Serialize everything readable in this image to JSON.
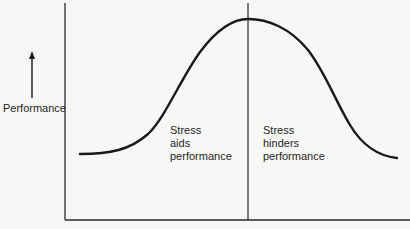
{
  "diagram": {
    "title": "",
    "type": "inverted-U performance curve",
    "y_axis": {
      "label": "Performance",
      "arrow": "up-arrow-icon"
    },
    "x_axis": {
      "label": ""
    },
    "divider": {
      "position": "peak"
    },
    "regions": [
      {
        "lines": [
          "Stress",
          "aids",
          "performance"
        ]
      },
      {
        "lines": [
          "Stress",
          "hinders",
          "performance"
        ]
      }
    ],
    "colors": {
      "background": "#f7f7f5",
      "line": "#1a1a1a",
      "axis": "#2a2a2a",
      "text": "#1f1f1f"
    }
  }
}
